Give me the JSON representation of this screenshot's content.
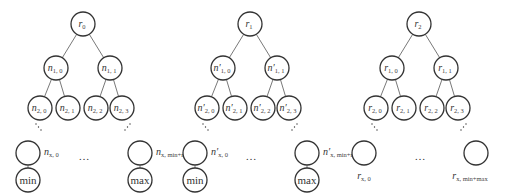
{
  "diagram": {
    "type": "three binary trees (hash-tree style) with leaf chains",
    "trees": [
      {
        "id": "tree-0",
        "root": {
          "base": "r",
          "sub": "0"
        },
        "level1": [
          {
            "base": "n",
            "sub": "1, 0"
          },
          {
            "base": "n",
            "sub": "1, 1"
          }
        ],
        "level2": [
          {
            "base": "n",
            "sub": "2, 0"
          },
          {
            "base": "n",
            "sub": "2, 1"
          },
          {
            "base": "n",
            "sub": "2, 2"
          },
          {
            "base": "n",
            "sub": "2, 3"
          }
        ],
        "leaf_left": {
          "base": "n",
          "sub": "x, 0",
          "child": "min"
        },
        "leaf_right": {
          "base": "n",
          "sub": "x, min+max",
          "child": "max"
        },
        "ellipsis": "…"
      },
      {
        "id": "tree-1",
        "root": {
          "base": "r",
          "sub": "1"
        },
        "level1": [
          {
            "base": "n′",
            "sub": "1, 0"
          },
          {
            "base": "n′",
            "sub": "1, 1"
          }
        ],
        "level2": [
          {
            "base": "n′",
            "sub": "2, 0"
          },
          {
            "base": "n′",
            "sub": "2, 1"
          },
          {
            "base": "n′",
            "sub": "2, 2"
          },
          {
            "base": "n′",
            "sub": "2, 3"
          }
        ],
        "leaf_left": {
          "base": "n′",
          "sub": "x, 0",
          "child": "min"
        },
        "leaf_right": {
          "base": "n′",
          "sub": "x, min+max",
          "child": "max"
        },
        "ellipsis": "…"
      },
      {
        "id": "tree-2",
        "root": {
          "base": "r",
          "sub": "2"
        },
        "level1": [
          {
            "base": "r",
            "sub": "1, 0"
          },
          {
            "base": "r",
            "sub": "1, 1"
          }
        ],
        "level2": [
          {
            "base": "r",
            "sub": "2, 0"
          },
          {
            "base": "r",
            "sub": "2, 1"
          },
          {
            "base": "r",
            "sub": "2, 2"
          },
          {
            "base": "r",
            "sub": "2, 3"
          }
        ],
        "leaf_left": {
          "base": "r",
          "sub": "x, 0",
          "child": null
        },
        "leaf_right": {
          "base": "r",
          "sub": "x, min+max",
          "child": null
        },
        "ellipsis": "…"
      }
    ],
    "colors": {
      "stroke": "#333333",
      "edge": "#555555",
      "text": "#333333",
      "background": "#ffffff"
    }
  }
}
